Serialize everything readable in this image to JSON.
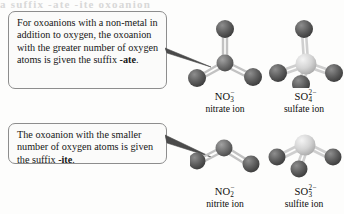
{
  "page": {
    "top_remnant_text": "a suffix -ate -ite oxoanion"
  },
  "callouts": [
    {
      "id": "ate",
      "text_before": "For oxoanions with a non-metal in addition to oxygen, the oxoanion with the greater number of oxygen atoms is given the suffix ",
      "suffix_bold": "-ate",
      "text_after": ".",
      "points_to": "nitrate-ion-model"
    },
    {
      "id": "ite",
      "text_before": "The oxoanion with the smaller number of oxygen atoms is given the suffix ",
      "suffix_bold": "-ite",
      "text_after": ".",
      "points_to": "nitrite-ion-model"
    }
  ],
  "molecules": [
    {
      "id": "nitrate",
      "formula_main": "NO",
      "formula_sub": "3",
      "formula_sup": "−",
      "name": "nitrate ion",
      "geometry": "trigonal-planar",
      "central_atom": "N",
      "central_color": "#6f6f6f",
      "oxygen_count": 3,
      "oxygen_color": "#5a5a5a"
    },
    {
      "id": "sulfate",
      "formula_main": "SO",
      "formula_sub": "4",
      "formula_sup": "2−",
      "name": "sulfate ion",
      "geometry": "tetrahedral",
      "central_atom": "S",
      "central_color": "#d2d2d2",
      "oxygen_count": 4,
      "oxygen_color": "#5a5a5a"
    },
    {
      "id": "nitrite",
      "formula_main": "NO",
      "formula_sub": "2",
      "formula_sup": "−",
      "name": "nitrite ion",
      "geometry": "bent",
      "central_atom": "N",
      "central_color": "#6f6f6f",
      "oxygen_count": 2,
      "oxygen_color": "#5a5a5a"
    },
    {
      "id": "sulfite",
      "formula_main": "SO",
      "formula_sub": "3",
      "formula_sup": "2−",
      "name": "sulfite ion",
      "geometry": "trigonal-pyramidal",
      "central_atom": "S",
      "central_color": "#d2d2d2",
      "oxygen_count": 3,
      "oxygen_color": "#5a5a5a"
    }
  ],
  "colors": {
    "background": "#fdfdfc",
    "box_border": "#8d8d8d",
    "box_fill": "#fbfbfa",
    "text": "#161616",
    "oxygen": "#5a5a5a",
    "nitrogen": "#6f6f6f",
    "sulfur": "#d2d2d2",
    "bond": "#b6b6b6"
  }
}
